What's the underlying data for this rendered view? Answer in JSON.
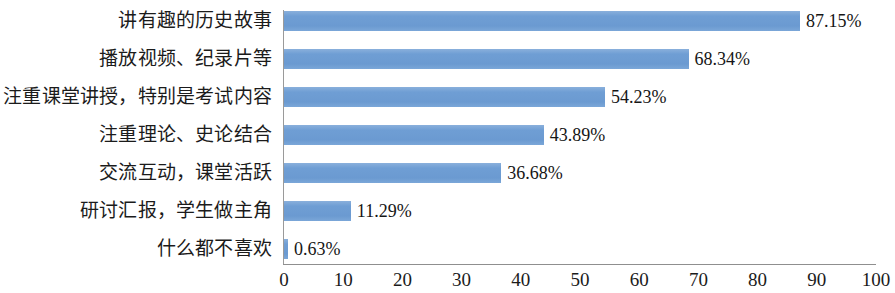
{
  "chart_data": {
    "type": "bar",
    "orientation": "horizontal",
    "title": "",
    "subtitle": "",
    "xlabel": "",
    "ylabel": "",
    "xlim": [
      0,
      100
    ],
    "ylim": null,
    "grid": false,
    "legend": null,
    "legend_position": "none",
    "xticks": [
      "0",
      "10",
      "20",
      "30",
      "40",
      "50",
      "60",
      "70",
      "80",
      "90",
      "100"
    ],
    "xtick_values": [
      0,
      10,
      20,
      30,
      40,
      50,
      60,
      70,
      80,
      90,
      100
    ],
    "bar_color": "#6f9ed4",
    "axis_color": "#8f8f8f",
    "categories": [
      "讲有趣的历史故事",
      "播放视频、纪录片等",
      "注重课堂讲授，特别是考试内容",
      "注重理论、史论结合",
      "交流互动，课堂活跃",
      "研讨汇报，学生做主角",
      "什么都不喜欢"
    ],
    "values": [
      87.15,
      68.34,
      54.23,
      43.89,
      36.68,
      11.29,
      0.63
    ],
    "value_labels": [
      "87.15%",
      "68.34%",
      "54.23%",
      "43.89%",
      "36.68%",
      "11.29%",
      "0.63%"
    ]
  }
}
